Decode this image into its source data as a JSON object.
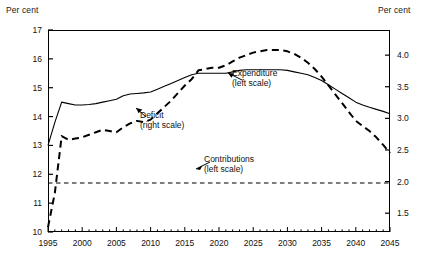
{
  "axis_unit_left": "Per cent",
  "axis_unit_right": "Per cent",
  "y_left_ticks": [
    "10",
    "11",
    "12",
    "13",
    "14",
    "15",
    "16",
    "17"
  ],
  "y_right_ticks": [
    "1.5",
    "2.0",
    "2.5",
    "3.0",
    "3.5",
    "4.0"
  ],
  "x_ticks": [
    "1995",
    "2000",
    "2005",
    "2010",
    "2015",
    "2020",
    "2025",
    "2030",
    "2035",
    "2040",
    "2045"
  ],
  "annotations": {
    "expenditure_line1": "Expenditure",
    "expenditure_line2": "(left scale)",
    "deficit_line1": "Deficit",
    "deficit_line2": "(right scale)",
    "contributions_line1": "Contributions",
    "contributions_line2": "(left scale)"
  },
  "colors": {
    "axis": "#000000",
    "expenditure": "#000000",
    "deficit": "#000000",
    "contributions": "#000000",
    "background": "#ffffff"
  },
  "chart_data": {
    "type": "line",
    "title": "",
    "xlabel": "",
    "ylabel": "Per cent",
    "y2label": "Per cent",
    "xlim": [
      1995,
      2045
    ],
    "ylim": [
      10,
      17
    ],
    "y2lim": [
      1.2024,
      4.3976
    ],
    "y_left_tick_values": [
      10,
      11,
      12,
      13,
      14,
      15,
      16,
      17
    ],
    "y_right_tick_values": [
      1.5,
      2.0,
      2.5,
      3.0,
      3.5,
      4.0
    ],
    "x_tick_values": [
      1995,
      2000,
      2005,
      2010,
      2015,
      2020,
      2025,
      2030,
      2035,
      2040,
      2045
    ],
    "x_minor_tick_interval": 1,
    "grid": false,
    "legend_position": "inline-annotations",
    "series": [
      {
        "name": "Expenditure (left scale)",
        "axis": "left",
        "style": "solid",
        "x": [
          1995,
          1996,
          1997,
          1998,
          1999,
          2000,
          2001,
          2002,
          2003,
          2004,
          2005,
          2006,
          2007,
          2008,
          2009,
          2010,
          2011,
          2012,
          2013,
          2014,
          2015,
          2016,
          2017,
          2018,
          2019,
          2020,
          2021,
          2022,
          2023,
          2024,
          2025,
          2026,
          2027,
          2028,
          2029,
          2030,
          2031,
          2032,
          2033,
          2034,
          2035,
          2036,
          2037,
          2038,
          2039,
          2040,
          2041,
          2042,
          2043,
          2044,
          2045
        ],
        "values": [
          13.0,
          13.8,
          14.5,
          14.45,
          14.4,
          14.4,
          14.42,
          14.45,
          14.5,
          14.55,
          14.6,
          14.72,
          14.78,
          14.8,
          14.82,
          14.85,
          14.95,
          15.05,
          15.15,
          15.25,
          15.35,
          15.45,
          15.5,
          15.5,
          15.5,
          15.5,
          15.5,
          15.55,
          15.6,
          15.62,
          15.62,
          15.62,
          15.62,
          15.62,
          15.62,
          15.6,
          15.55,
          15.5,
          15.45,
          15.35,
          15.25,
          15.1,
          14.95,
          14.8,
          14.65,
          14.5,
          14.4,
          14.32,
          14.25,
          14.18,
          14.1
        ]
      },
      {
        "name": "Deficit (right scale)",
        "axis": "right",
        "style": "dashed",
        "x": [
          1995,
          1996,
          1997,
          1998,
          1999,
          2000,
          2001,
          2002,
          2003,
          2004,
          2005,
          2006,
          2007,
          2008,
          2009,
          2010,
          2011,
          2012,
          2013,
          2014,
          2015,
          2016,
          2017,
          2018,
          2019,
          2020,
          2021,
          2022,
          2023,
          2024,
          2025,
          2026,
          2027,
          2028,
          2029,
          2030,
          2031,
          2032,
          2033,
          2034,
          2035,
          2036,
          2037,
          2038,
          2039,
          2040,
          2041,
          2042,
          2043,
          2044,
          2045
        ],
        "values": [
          1.28,
          1.82,
          2.72,
          2.66,
          2.68,
          2.7,
          2.74,
          2.78,
          2.82,
          2.8,
          2.78,
          2.86,
          2.92,
          2.96,
          2.94,
          2.98,
          3.08,
          3.18,
          3.28,
          3.4,
          3.52,
          3.62,
          3.76,
          3.78,
          3.8,
          3.8,
          3.84,
          3.9,
          3.96,
          4.0,
          4.04,
          4.06,
          4.08,
          4.08,
          4.08,
          4.06,
          4.02,
          3.96,
          3.88,
          3.78,
          3.66,
          3.52,
          3.38,
          3.24,
          3.1,
          2.96,
          2.88,
          2.8,
          2.7,
          2.58,
          2.45
        ]
      },
      {
        "name": "Contributions (left scale)",
        "axis": "left",
        "style": "dashed-flat",
        "x": [
          1995,
          2045
        ],
        "values": [
          11.7,
          11.7
        ]
      }
    ]
  }
}
